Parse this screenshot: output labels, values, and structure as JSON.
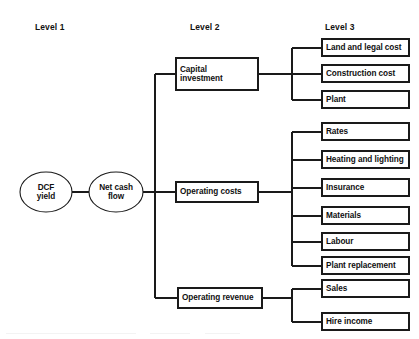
{
  "diagram": {
    "type": "tree-diagram",
    "stroke_color": "#1a1a1a",
    "text_color": "#101010",
    "background_color": "#ffffff"
  },
  "headers": [
    {
      "label": "Level 1"
    },
    {
      "label": "Level 2"
    },
    {
      "label": "Level 3"
    }
  ],
  "level1": {
    "nodes": [
      {
        "label": "DCF\nyield",
        "shape": "ellipse"
      },
      {
        "label": "Net cash\nflow",
        "shape": "ellipse"
      }
    ]
  },
  "level2": {
    "nodes": [
      {
        "label": "Capital\ninvestment",
        "shape": "rect"
      },
      {
        "label": "Operating costs",
        "shape": "rect"
      },
      {
        "label": "Operating revenue",
        "shape": "rect"
      }
    ]
  },
  "level3": {
    "groups": [
      {
        "parent": "Capital investment",
        "items": [
          {
            "label": "Land and legal cost"
          },
          {
            "label": "Construction cost"
          },
          {
            "label": "Plant"
          }
        ]
      },
      {
        "parent": "Operating costs",
        "items": [
          {
            "label": "Rates"
          },
          {
            "label": "Heating and lighting"
          },
          {
            "label": "Insurance"
          },
          {
            "label": "Materials"
          },
          {
            "label": "Labour"
          },
          {
            "label": "Plant replacement"
          }
        ]
      },
      {
        "parent": "Operating revenue",
        "items": [
          {
            "label": "Sales"
          },
          {
            "label": "Hire income"
          }
        ]
      }
    ]
  }
}
